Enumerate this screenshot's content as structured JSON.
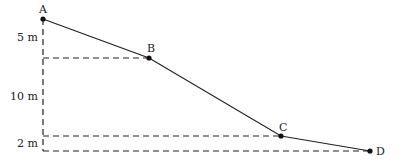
{
  "diagram": {
    "type": "slope-profile",
    "points": [
      {
        "id": "A",
        "label": "A",
        "x": 43,
        "y": 19
      },
      {
        "id": "B",
        "label": "B",
        "x": 149,
        "y": 58
      },
      {
        "id": "C",
        "label": "C",
        "x": 281,
        "y": 136
      },
      {
        "id": "D",
        "label": "D",
        "x": 370,
        "y": 151
      }
    ],
    "height_labels": [
      {
        "id": "h1",
        "text": "5 m",
        "between": [
          "A",
          "B"
        ]
      },
      {
        "id": "h2",
        "text": "10 m",
        "between": [
          "B",
          "C"
        ]
      },
      {
        "id": "h3",
        "text": "2 m",
        "between": [
          "C",
          "D"
        ]
      }
    ],
    "line_color": "#222222"
  }
}
